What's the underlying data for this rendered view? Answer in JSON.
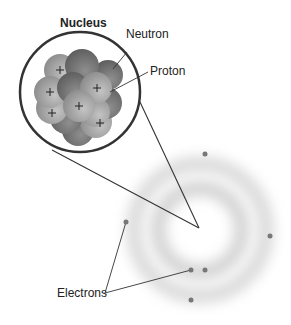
{
  "diagram": {
    "title": "Nucleus",
    "labels": {
      "neutron": "Neutron",
      "proton": "Proton",
      "electrons": "Electrons"
    },
    "colors": {
      "proton": "#9a9a9a",
      "neutron": "#6e6e6e",
      "outline": "#333333",
      "cloud": "#c8c8c8",
      "electron": "#777777"
    },
    "electron_count": 6
  }
}
